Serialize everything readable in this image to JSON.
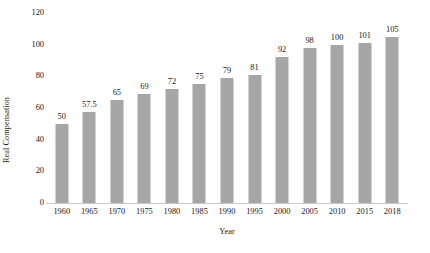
{
  "chart_data": {
    "type": "bar",
    "title": "",
    "xlabel": "Year",
    "ylabel": "Real Compensation",
    "categories": [
      "1960",
      "1965",
      "1970",
      "1975",
      "1980",
      "1985",
      "1990",
      "1995",
      "2000",
      "2005",
      "2010",
      "2015",
      "2018"
    ],
    "values": [
      50,
      57.5,
      65,
      69,
      72,
      75,
      79,
      81,
      92,
      98,
      100,
      101,
      105
    ],
    "value_labels": [
      "50",
      "57.5",
      "65",
      "69",
      "72",
      "75",
      "79",
      "81",
      "92",
      "98",
      "100",
      "101",
      "105"
    ],
    "ylim": [
      0,
      120
    ],
    "yticks": [
      0,
      20,
      40,
      60,
      80,
      100,
      120
    ],
    "ytick_labels": [
      "0",
      "20",
      "40",
      "60",
      "80",
      "100",
      "120"
    ],
    "grid": false,
    "legend": false,
    "legend_position": "none",
    "bar_color": "#a6a6a6",
    "axis_color": "#c9c9c9",
    "text_color": "#1a1a1a",
    "background": "#ffffff"
  }
}
